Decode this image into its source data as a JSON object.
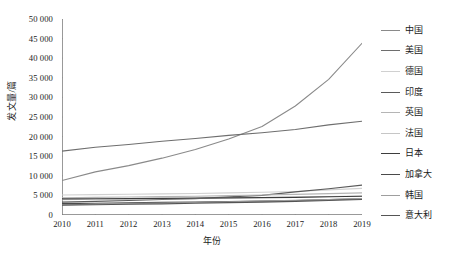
{
  "chart_data": {
    "type": "line",
    "title": "",
    "xlabel": "年份",
    "ylabel": "发文量/篇",
    "x": [
      2010,
      2011,
      2012,
      2013,
      2014,
      2015,
      2016,
      2017,
      2018,
      2019
    ],
    "xlim": [
      2010,
      2019
    ],
    "ylim": [
      0,
      50000
    ],
    "yticks": [
      0,
      5000,
      10000,
      15000,
      20000,
      25000,
      30000,
      35000,
      40000,
      45000,
      50000
    ],
    "ytick_labels": [
      "0",
      "5 000",
      "10 000",
      "15 000",
      "20 000",
      "25 000",
      "30 000",
      "35 000",
      "40 000",
      "45 000",
      "50 000"
    ],
    "xtick_labels": [
      "2010",
      "2011",
      "2012",
      "2013",
      "2014",
      "2015",
      "2016",
      "2017",
      "2018",
      "2019"
    ],
    "grid": false,
    "legend_position": "right",
    "series": [
      {
        "name": "中国",
        "color": "#8a8a8a",
        "width": 1.1,
        "values": [
          8800,
          11000,
          12600,
          14500,
          16700,
          19400,
          22600,
          27800,
          34600,
          43800
        ]
      },
      {
        "name": "美国",
        "color": "#6e6e6e",
        "width": 1.1,
        "values": [
          16300,
          17300,
          18000,
          18800,
          19500,
          20300,
          21000,
          21800,
          23000,
          23900
        ]
      },
      {
        "name": "德国",
        "color": "#d0d0d0",
        "width": 1.1,
        "values": [
          5100,
          5200,
          5300,
          5400,
          5500,
          5650,
          5800,
          6000,
          6400,
          6800
        ]
      },
      {
        "name": "印度",
        "color": "#5a5a5a",
        "width": 1.2,
        "values": [
          3300,
          3500,
          3700,
          3950,
          4200,
          4600,
          5000,
          5900,
          6700,
          7600
        ]
      },
      {
        "name": "英国",
        "color": "#b5b5b5",
        "width": 1.1,
        "values": [
          4400,
          4500,
          4600,
          4700,
          4800,
          4950,
          5100,
          5250,
          5450,
          5650
        ]
      },
      {
        "name": "法国",
        "color": "#c6c6c6",
        "width": 1.1,
        "values": [
          3900,
          4000,
          4080,
          4150,
          4250,
          4350,
          4450,
          4550,
          4700,
          4850
        ]
      },
      {
        "name": "日本",
        "color": "#3d3d3d",
        "width": 1.2,
        "values": [
          4100,
          4150,
          4200,
          4250,
          4300,
          4380,
          4450,
          4520,
          4650,
          4780
        ]
      },
      {
        "name": "加拿大",
        "color": "#4a4a4a",
        "width": 1.2,
        "values": [
          2900,
          3000,
          3100,
          3200,
          3300,
          3420,
          3550,
          3700,
          3900,
          4100
        ]
      },
      {
        "name": "韩国",
        "color": "#9e9e9e",
        "width": 1.1,
        "values": [
          2600,
          2750,
          2900,
          3050,
          3200,
          3380,
          3550,
          3720,
          3950,
          4200
        ]
      },
      {
        "name": "意大利",
        "color": "#555555",
        "width": 1.2,
        "values": [
          2500,
          2620,
          2740,
          2860,
          3000,
          3150,
          3300,
          3480,
          3700,
          3950
        ]
      }
    ]
  },
  "axes": {
    "x_title": "年份",
    "y_title": "发文量/篇"
  }
}
